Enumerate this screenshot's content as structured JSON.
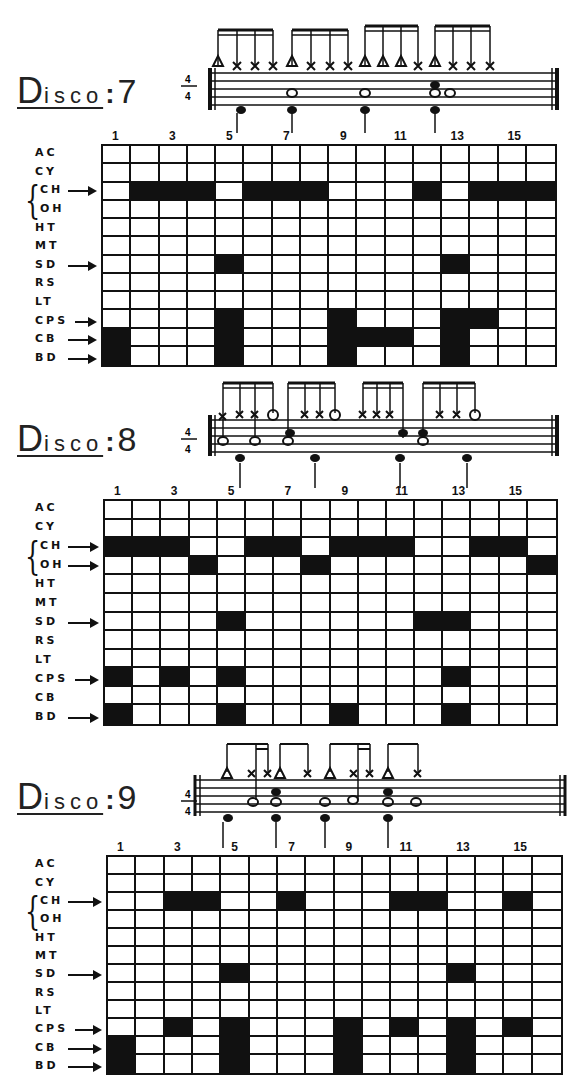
{
  "time_signature": {
    "top": "4",
    "bottom": "4"
  },
  "step_numbers": [
    "1",
    "3",
    "5",
    "7",
    "9",
    "11",
    "13",
    "15"
  ],
  "instruments": [
    "AC",
    "CY",
    "CH",
    "OH",
    "HT",
    "MT",
    "SD",
    "RS",
    "LT",
    "CPS",
    "CB",
    "BD"
  ],
  "colors": {
    "ink": "#111111",
    "paper": "#ffffff"
  },
  "patterns": [
    {
      "title_initial": "D",
      "title_rest": "isco",
      "title_colon": ":",
      "title_number": "7",
      "arrows": [
        "CH",
        "SD",
        "CPS",
        "CB",
        "BD"
      ],
      "steps_on": {
        "AC": [],
        "CY": [],
        "CH": [
          2,
          3,
          4,
          6,
          7,
          8,
          12,
          14,
          15,
          16
        ],
        "OH": [],
        "HT": [],
        "MT": [],
        "SD": [
          5,
          13
        ],
        "RS": [],
        "LT": [],
        "CPS": [
          5,
          9,
          13,
          14
        ],
        "CB": [
          1,
          5,
          9,
          10,
          11,
          13
        ],
        "BD": [
          1,
          5,
          9,
          13
        ]
      }
    },
    {
      "title_initial": "D",
      "title_rest": "isco",
      "title_colon": ":",
      "title_number": "8",
      "arrows": [
        "CH",
        "OH",
        "SD",
        "CPS",
        "BD"
      ],
      "steps_on": {
        "AC": [],
        "CY": [],
        "CH": [
          1,
          2,
          3,
          6,
          7,
          9,
          10,
          11,
          14,
          15
        ],
        "OH": [
          4,
          8,
          16
        ],
        "HT": [],
        "MT": [],
        "SD": [
          5,
          12,
          13
        ],
        "RS": [],
        "LT": [],
        "CPS": [
          1,
          3,
          5,
          13
        ],
        "CB": [],
        "BD": [
          1,
          5,
          9,
          13
        ]
      }
    },
    {
      "title_initial": "D",
      "title_rest": "isco",
      "title_colon": ":",
      "title_number": "9",
      "arrows": [
        "CH",
        "SD",
        "CPS",
        "CB",
        "BD"
      ],
      "steps_on": {
        "AC": [],
        "CY": [],
        "CH": [
          3,
          4,
          7,
          11,
          12,
          15
        ],
        "OH": [],
        "HT": [],
        "MT": [],
        "SD": [
          5,
          13
        ],
        "RS": [],
        "LT": [],
        "CPS": [
          3,
          5,
          9,
          11,
          13,
          15
        ],
        "CB": [
          1,
          5,
          9,
          13
        ],
        "BD": [
          1,
          5,
          9,
          13
        ]
      }
    }
  ]
}
